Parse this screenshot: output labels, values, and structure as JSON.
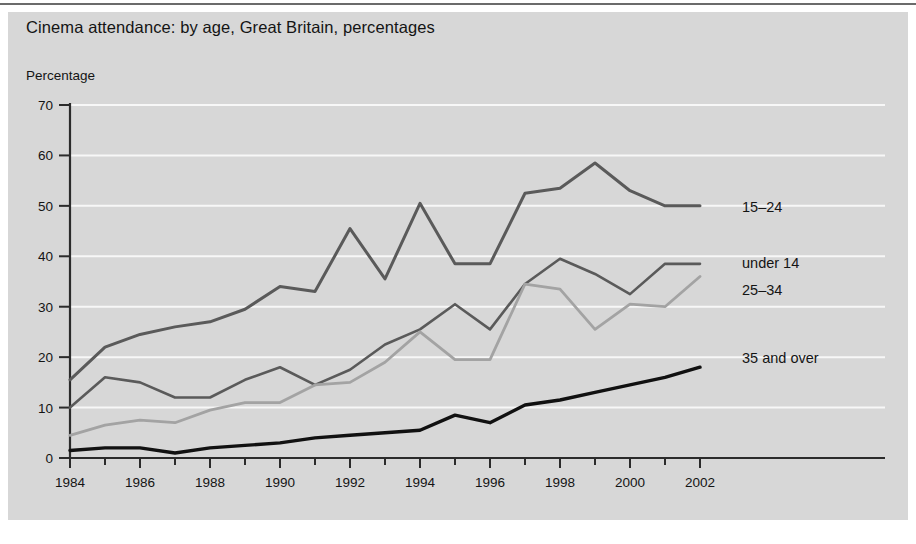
{
  "figure": {
    "title": "Cinema attendance: by age, Great Britain, percentages",
    "y_axis_title": "Percentage",
    "panel_color": "#d7d7d7",
    "gridline_color": "#f7f7f7",
    "axis_color": "#2b2b2b"
  },
  "chart_data": {
    "type": "line",
    "title": "Cinema attendance: by age, Great Britain, percentages",
    "subtitle": "",
    "xlabel": "",
    "ylabel": "Percentage",
    "xlim": [
      1984,
      2002
    ],
    "ylim": [
      0,
      70
    ],
    "grid": true,
    "grid_axis": "y",
    "legend_position": "right-inline-labels",
    "y_ticks": [
      0,
      10,
      20,
      30,
      40,
      50,
      60,
      70
    ],
    "x_ticks": [
      1984,
      1986,
      1988,
      1990,
      1992,
      1994,
      1996,
      1998,
      2000,
      2002
    ],
    "x_tick_labels": [
      "1984",
      "1986",
      "1988",
      "1990",
      "1992",
      "1994",
      "1996",
      "1998",
      "2000",
      "2002"
    ],
    "x": [
      1984,
      1985,
      1986,
      1987,
      1988,
      1989,
      1990,
      1991,
      1992,
      1993,
      1994,
      1995,
      1996,
      1997,
      1998,
      1999,
      2000,
      2001,
      2002
    ],
    "series": [
      {
        "name": "15-24",
        "color": "#5a5a5a",
        "stroke_width": 3.0,
        "label": "15–24",
        "label_x": 2003.2,
        "label_y": 49.5,
        "values": [
          15.5,
          22.0,
          24.5,
          26.0,
          27.0,
          29.5,
          34.0,
          33.0,
          45.5,
          35.5,
          50.5,
          38.5,
          38.5,
          52.5,
          53.5,
          58.5,
          53.0,
          50.0,
          50.0
        ]
      },
      {
        "name": "under 14",
        "color": "#5a5a5a",
        "stroke_width": 2.6,
        "label": "under 14",
        "label_x": 2003.2,
        "label_y": 38.5,
        "values": [
          10.0,
          16.0,
          15.0,
          12.0,
          12.0,
          15.5,
          18.0,
          14.5,
          17.5,
          22.5,
          25.5,
          30.5,
          25.5,
          34.5,
          39.5,
          36.5,
          32.5,
          38.5,
          38.5
        ]
      },
      {
        "name": "25-34",
        "color": "#a3a3a3",
        "stroke_width": 2.8,
        "label": "25–34",
        "label_x": 2003.2,
        "label_y": 33.0,
        "values": [
          4.5,
          6.5,
          7.5,
          7.0,
          9.5,
          11.0,
          11.0,
          14.5,
          15.0,
          19.0,
          25.0,
          19.5,
          19.5,
          34.5,
          33.5,
          25.5,
          30.5,
          30.0,
          36.0
        ]
      },
      {
        "name": "35 and over",
        "color": "#111111",
        "stroke_width": 3.4,
        "label": "35 and over",
        "label_x": 2003.2,
        "label_y": 19.5,
        "values": [
          1.5,
          2.0,
          2.0,
          1.0,
          2.0,
          2.5,
          3.0,
          4.0,
          4.5,
          5.0,
          5.5,
          8.5,
          7.0,
          10.5,
          11.5,
          13.0,
          14.5,
          16.0,
          18.0
        ]
      }
    ]
  }
}
